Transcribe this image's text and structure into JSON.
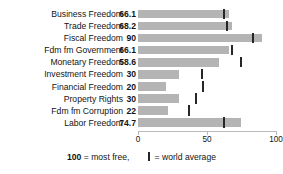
{
  "title_sliver": "",
  "chart_data": {
    "type": "bar",
    "title": "",
    "xlabel": "",
    "ylabel": "",
    "xlim": [
      0,
      100
    ],
    "grid": false,
    "orientation": "horizontal",
    "categories": [
      "Business Freedom",
      "Trade Freedom",
      "Fiscal Freedom",
      "Fdm fm Government",
      "Monetary Freedom",
      "Investment Freedom",
      "Financial Freedom",
      "Property Rights",
      "Fdm fm Corruption",
      "Labor Freedom"
    ],
    "values": [
      66.1,
      68.2,
      90,
      66.1,
      58.6,
      30,
      20,
      30,
      22,
      74.7
    ],
    "value_labels": [
      "66.1",
      "68.2",
      "90",
      "66.1",
      "58.6",
      "30",
      "20",
      "30",
      "22",
      "74.7"
    ],
    "world_average": [
      62.3,
      64.5,
      83.5,
      68.0,
      74.5,
      46.5,
      47.0,
      42.0,
      37.0,
      62.5
    ],
    "series": [
      {
        "name": "score",
        "values": [
          66.1,
          68.2,
          90,
          66.1,
          58.6,
          30,
          20,
          30,
          22,
          74.7
        ]
      },
      {
        "name": "world average",
        "values": [
          62.3,
          64.5,
          83.5,
          68.0,
          74.5,
          46.5,
          47.0,
          42.0,
          37.0,
          62.5
        ]
      }
    ],
    "ticks": [
      0,
      50,
      100
    ],
    "tick_labels": [
      "0",
      "50",
      "100"
    ],
    "bar_color": "#b4b4b4",
    "marker_color": "#262626"
  },
  "legend": {
    "most_free_value": "100",
    "most_free_text": "= most free,",
    "average_text": "= world average"
  }
}
